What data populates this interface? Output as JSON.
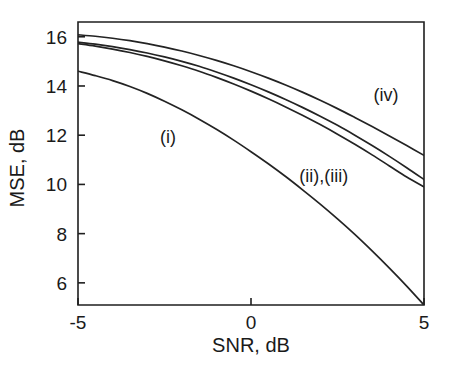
{
  "chart_data": {
    "type": "line",
    "title": "",
    "subtitle": "",
    "xlabel": "SNR, dB",
    "ylabel": "MSE, dB",
    "xlim": [
      -5,
      5
    ],
    "ylim": [
      5.1,
      16.6
    ],
    "xticks": [
      -5,
      0,
      5
    ],
    "xticklabels": [
      "-5",
      "0",
      "5"
    ],
    "yticks": [
      6,
      8,
      10,
      12,
      14,
      16
    ],
    "yticklabels": [
      "6",
      "8",
      "10",
      "12",
      "14",
      "16"
    ],
    "grid": false,
    "legend_position": "inline-annotations",
    "annotations": [
      {
        "text": "(i)",
        "x": -2.4,
        "y": 11.7
      },
      {
        "text": "(ii),(iii)",
        "x": 2.1,
        "y": 10.1
      },
      {
        "text": "(iv)",
        "x": 3.9,
        "y": 13.4
      }
    ],
    "x": [
      -5,
      -4.5,
      -4,
      -3.5,
      -3,
      -2.5,
      -2,
      -1.5,
      -1,
      -0.5,
      0,
      0.5,
      1,
      1.5,
      2,
      2.5,
      3,
      3.5,
      4,
      4.5,
      5
    ],
    "series": [
      {
        "name": "(i)",
        "label": "(i)",
        "values": [
          14.6,
          14.42,
          14.22,
          13.98,
          13.7,
          13.38,
          13.03,
          12.65,
          12.24,
          11.8,
          11.33,
          10.84,
          10.32,
          9.77,
          9.2,
          8.6,
          7.97,
          7.3,
          6.6,
          5.87,
          5.1
        ]
      },
      {
        "name": "(ii)",
        "label": "(ii)",
        "values": [
          15.78,
          15.7,
          15.6,
          15.48,
          15.34,
          15.18,
          15.0,
          14.8,
          14.57,
          14.32,
          14.05,
          13.76,
          13.45,
          13.12,
          12.77,
          12.4,
          12.0,
          11.58,
          11.14,
          10.68,
          10.2
        ]
      },
      {
        "name": "(iii)",
        "label": "(iii)",
        "values": [
          15.72,
          15.62,
          15.5,
          15.36,
          15.2,
          15.02,
          14.82,
          14.6,
          14.35,
          14.08,
          13.79,
          13.48,
          13.15,
          12.8,
          12.43,
          12.04,
          11.63,
          11.2,
          10.75,
          10.3,
          9.9
        ]
      },
      {
        "name": "(iv)",
        "label": "(iv)",
        "values": [
          16.08,
          16.02,
          15.94,
          15.84,
          15.72,
          15.58,
          15.42,
          15.24,
          15.04,
          14.82,
          14.58,
          14.32,
          14.04,
          13.74,
          13.42,
          13.08,
          12.72,
          12.35,
          11.97,
          11.58,
          11.18
        ]
      }
    ]
  },
  "figure": {
    "background_color": "#ffffff",
    "line_color": "#232323",
    "axis_color": "#1f1f1f"
  }
}
